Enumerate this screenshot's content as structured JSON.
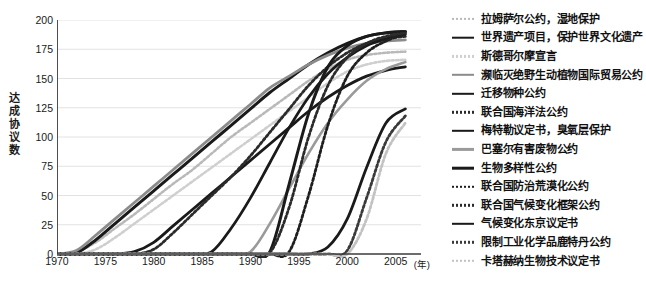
{
  "chart_data": {
    "type": "line",
    "title": "",
    "xlabel": "年",
    "ylabel": "达成协议数",
    "xlim": [
      1970,
      2007
    ],
    "ylim": [
      0,
      200
    ],
    "grid": true,
    "legend_position": "right",
    "x_ticks": [
      "1970",
      "1975",
      "1980",
      "1985",
      "1990",
      "1995",
      "2000",
      "2005"
    ],
    "x_tick_values": [
      1970,
      1975,
      1980,
      1985,
      1990,
      1995,
      2000,
      2005
    ],
    "x_unit_label": "(年)",
    "y_ticks": [
      "0",
      "25",
      "50",
      "75",
      "100",
      "125",
      "150",
      "175",
      "200"
    ],
    "y_tick_values": [
      0,
      25,
      50,
      75,
      100,
      125,
      150,
      175,
      200
    ],
    "x": [
      1970,
      1972,
      1974,
      1976,
      1978,
      1980,
      1982,
      1984,
      1986,
      1988,
      1990,
      1992,
      1994,
      1996,
      1998,
      2000,
      2002,
      2004,
      2006
    ],
    "series": [
      {
        "name": "拉姆萨尔公约，湿地保护",
        "style": "dotted",
        "color": "#b9b9b9",
        "width": 2.6,
        "values": [
          0,
          2,
          10,
          22,
          34,
          47,
          60,
          72,
          86,
          100,
          112,
          124,
          136,
          148,
          158,
          166,
          170,
          172,
          173
        ]
      },
      {
        "name": "世界遗产项目，保护世界文化遗产",
        "style": "solid",
        "color": "#1a1a1a",
        "width": 3.0,
        "values": [
          0,
          1,
          12,
          26,
          40,
          54,
          68,
          82,
          96,
          110,
          124,
          138,
          150,
          162,
          172,
          180,
          186,
          189,
          190
        ]
      },
      {
        "name": "斯德哥尔摩宣言",
        "style": "dotted",
        "color": "#cfcfcf",
        "width": 2.6,
        "values": [
          0,
          0,
          4,
          14,
          26,
          38,
          50,
          62,
          74,
          86,
          98,
          110,
          122,
          134,
          146,
          156,
          162,
          165,
          166
        ]
      },
      {
        "name": "濒临灭绝野生动植物国际贸易公约",
        "style": "solid",
        "color": "#8c8c8c",
        "width": 2.8,
        "values": [
          0,
          3,
          16,
          30,
          44,
          58,
          72,
          86,
          100,
          114,
          128,
          142,
          152,
          162,
          170,
          176,
          180,
          182,
          183
        ]
      },
      {
        "name": "迁移物种公约",
        "style": "solid",
        "color": "#1a1a1a",
        "width": 2.8,
        "values": [
          0,
          0,
          0,
          0,
          2,
          10,
          24,
          38,
          52,
          66,
          80,
          94,
          108,
          122,
          134,
          144,
          152,
          157,
          160
        ]
      },
      {
        "name": "联合国海洋法公约",
        "style": "dotted",
        "color": "#2b2b2b",
        "width": 2.8,
        "values": [
          0,
          0,
          0,
          0,
          0,
          4,
          18,
          34,
          50,
          66,
          84,
          104,
          124,
          144,
          160,
          172,
          180,
          184,
          186
        ]
      },
      {
        "name": "梅特勒议定书，臭氧层保护",
        "style": "solid",
        "color": "#1a1a1a",
        "width": 2.8,
        "values": [
          0,
          0,
          0,
          0,
          0,
          0,
          0,
          0,
          2,
          22,
          48,
          78,
          108,
          134,
          154,
          168,
          178,
          184,
          188
        ]
      },
      {
        "name": "巴塞尔有害废物公约",
        "style": "solid",
        "color": "#9a9a9a",
        "width": 2.6,
        "values": [
          0,
          0,
          0,
          0,
          0,
          0,
          0,
          0,
          0,
          0,
          2,
          26,
          56,
          86,
          112,
          132,
          148,
          158,
          164
        ]
      },
      {
        "name": "生物多样性公约",
        "style": "solid",
        "color": "#1a1a1a",
        "width": 3.0,
        "values": [
          0,
          0,
          0,
          0,
          0,
          0,
          0,
          0,
          0,
          0,
          0,
          2,
          60,
          120,
          160,
          178,
          186,
          189,
          190
        ]
      },
      {
        "name": "联合国防治荒漠化公约",
        "style": "dotted",
        "color": "#1f1f1f",
        "width": 2.8,
        "values": [
          0,
          0,
          0,
          0,
          0,
          0,
          0,
          0,
          0,
          0,
          0,
          0,
          2,
          50,
          110,
          152,
          172,
          182,
          188
        ]
      },
      {
        "name": "联合国气候变化框架公约",
        "style": "dotted",
        "color": "#2b2b2b",
        "width": 2.8,
        "values": [
          0,
          0,
          0,
          0,
          0,
          0,
          0,
          0,
          0,
          0,
          0,
          1,
          40,
          100,
          144,
          168,
          180,
          186,
          189
        ]
      },
      {
        "name": "气候变化东京议定书",
        "style": "solid",
        "color": "#1a1a1a",
        "width": 2.8,
        "values": [
          0,
          0,
          0,
          0,
          0,
          0,
          0,
          0,
          0,
          0,
          0,
          0,
          0,
          0,
          6,
          30,
          74,
          112,
          124
        ]
      },
      {
        "name": "限制工业化学品鹿特丹公约",
        "style": "dotted",
        "color": "#3a3a3a",
        "width": 2.8,
        "values": [
          0,
          0,
          0,
          0,
          0,
          0,
          0,
          0,
          0,
          0,
          0,
          0,
          0,
          0,
          0,
          3,
          48,
          96,
          118
        ]
      },
      {
        "name": "卡塔赫纳生物技术议定书",
        "style": "dotted",
        "color": "#c2c2c2",
        "width": 2.8,
        "values": [
          0,
          0,
          0,
          0,
          0,
          0,
          0,
          0,
          0,
          0,
          0,
          0,
          0,
          0,
          0,
          0,
          30,
          86,
          112
        ]
      }
    ]
  },
  "axes": {
    "y_title_chars": [
      "达",
      "成",
      "协",
      "议",
      "数"
    ]
  },
  "colors": {
    "axis": "#3b3b3b",
    "grid": "#e2e2e2",
    "text": "#1a1a1a",
    "background": "#ffffff"
  }
}
